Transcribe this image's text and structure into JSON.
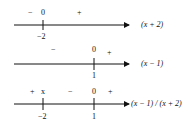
{
  "diagram": {
    "rows": [
      {
        "expression": "(x + 2)",
        "marks": [
          {
            "value": "-2",
            "symbol": "0"
          }
        ],
        "signs": [
          "−",
          "+"
        ]
      },
      {
        "expression": "(x − 1)",
        "marks": [
          {
            "value": "1",
            "symbol": "0"
          }
        ],
        "signs": [
          "−",
          "+"
        ]
      },
      {
        "expression": "(x − 1) / (x + 2)",
        "marks": [
          {
            "value": "-2",
            "symbol": "x"
          },
          {
            "value": "1",
            "symbol": "0"
          }
        ],
        "signs": [
          "+",
          "−",
          "+"
        ]
      }
    ],
    "row1": {
      "sign_left": "−",
      "zero": "0",
      "sign_right": "+",
      "tick": "−2",
      "label": "(x + 2)"
    },
    "row2": {
      "sign_left": "−",
      "zero": "0",
      "sign_right": "+",
      "tick": "1",
      "label": "(x − 1)"
    },
    "row3": {
      "sign_left": "+",
      "undef": "x",
      "sign_mid": "−",
      "zero": "0",
      "sign_right": "+",
      "tick1": "−2",
      "tick2": "1",
      "label": "(x − 1) / (x + 2)"
    },
    "colors": {
      "line": "#111111",
      "background": "#ffffff"
    }
  }
}
